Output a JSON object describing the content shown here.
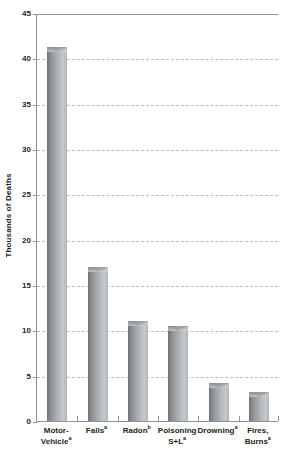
{
  "chart_data": {
    "type": "bar",
    "title": "",
    "xlabel": "",
    "ylabel": "Thousands of Deaths",
    "ylim": [
      0,
      45
    ],
    "ytick_values": [
      0,
      5,
      10,
      15,
      20,
      25,
      30,
      35,
      40,
      45
    ],
    "ytick_labels": [
      "0",
      "5",
      "10",
      "15",
      "20",
      "25",
      "30",
      "35",
      "40",
      "45"
    ],
    "grid": true,
    "legend": "none",
    "categories": [
      "Motor-Vehicle",
      "Falls",
      "Radon",
      "Poisoning S+L",
      "Drowning",
      "Fires, Burns"
    ],
    "category_labels": [
      {
        "lines": [
          "Motor-",
          "Vehicle"
        ],
        "footnote": "a"
      },
      {
        "lines": [
          "Falls"
        ],
        "footnote": "a"
      },
      {
        "lines": [
          "Radon"
        ],
        "footnote": "b"
      },
      {
        "lines": [
          "Poisoning",
          "S+L"
        ],
        "footnote": "a"
      },
      {
        "lines": [
          "Drowning"
        ],
        "footnote": "a"
      },
      {
        "lines": [
          "Fires,",
          "Burns"
        ],
        "footnote": "a"
      }
    ],
    "values": [
      41.2,
      17.0,
      11.0,
      10.5,
      4.2,
      3.2
    ],
    "bar_color": "#a8abae",
    "axis_color": "#8f9396",
    "gridline_color": "#b9bdc0",
    "text_color": "#231f20"
  }
}
